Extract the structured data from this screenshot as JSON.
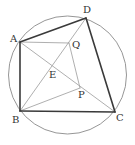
{
  "diagram": {
    "type": "geometry",
    "colors": {
      "background": "#ffffff",
      "circle": "#8a8a8a",
      "thick_edge": "#3a3a3a",
      "thin_edge": "#9a9a9a",
      "label": "#333333"
    },
    "circle": {
      "cx": 67.5,
      "cy": 75,
      "r": 59
    },
    "points": {
      "A": {
        "x": 20,
        "y": 42,
        "label": "A",
        "lx": 10,
        "ly": 42
      },
      "B": {
        "x": 20,
        "y": 111,
        "label": "B",
        "lx": 12,
        "ly": 123
      },
      "C": {
        "x": 115,
        "y": 112,
        "label": "C",
        "lx": 116,
        "ly": 121
      },
      "D": {
        "x": 86,
        "y": 18,
        "label": "D",
        "lx": 83,
        "ly": 13
      },
      "E": {
        "x": 51,
        "y": 68,
        "label": "E",
        "lx": 49,
        "ly": 78
      },
      "P": {
        "x": 80,
        "y": 88,
        "label": "P",
        "lx": 78,
        "ly": 98
      },
      "Q": {
        "x": 69,
        "y": 43,
        "label": "Q",
        "lx": 72,
        "ly": 48
      }
    },
    "thick_edges": [
      [
        "A",
        "D"
      ],
      [
        "D",
        "C"
      ],
      [
        "C",
        "B"
      ],
      [
        "B",
        "A"
      ]
    ],
    "thin_edges": [
      [
        "A",
        "Q"
      ],
      [
        "Q",
        "P"
      ],
      [
        "B",
        "P"
      ],
      [
        "A",
        "C"
      ],
      [
        "B",
        "D"
      ]
    ]
  }
}
